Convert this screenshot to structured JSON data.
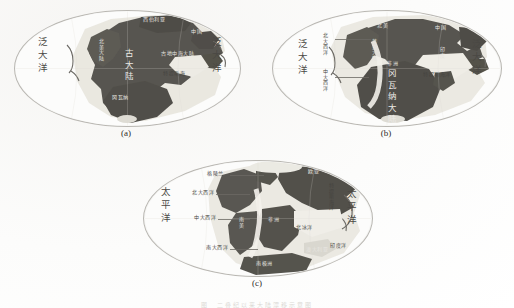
{
  "figure": {
    "bottom_caption": "图  二叠纪以来大陆漂移示意图",
    "panels": [
      {
        "id": "a",
        "caption": "(a)",
        "labels": {
          "left_ocean": "泛大洋",
          "right_ocean": "泛大洋",
          "center_land": "古大陆",
          "north_land": "西伯利亚",
          "northwest_land": "北美大陆",
          "northeast_land": "中国",
          "east_land": "中国",
          "tethys": "特提斯海",
          "south_land": "冈瓦纳",
          "inner_sea": "古地中海大陆"
        }
      },
      {
        "id": "b",
        "caption": "(b)",
        "labels": {
          "left_ocean": "泛大洋",
          "right_ocean": "泛大洋",
          "north_atlantic": "北大西洋",
          "central_atlantic": "中大西洋",
          "gondwana": "冈瓦纳大陆",
          "tethys": "特提斯海洋",
          "north_land": "北美",
          "northeast_land": "中国",
          "laurasia": "劳亚大陆",
          "africa": "非洲",
          "east_land": "印度"
        }
      },
      {
        "id": "c",
        "caption": "(c)",
        "labels": {
          "left_ocean": "太平洋",
          "right_ocean": "太平洋",
          "greenland": "格陵兰",
          "north_atlantic": "北大西洋",
          "central_atlantic": "中大西洋",
          "south_atlantic": "南大西洋",
          "tethys": "特提斯海洋",
          "indian_ocean": "印度洋",
          "arctic_ocean": "北冰洋",
          "antarctic": "南极洲",
          "africa": "非洲",
          "south_america": "南美",
          "eurasia": "欧亚",
          "australia": "澳大利亚"
        }
      }
    ]
  },
  "colors": {
    "land": "#5b5954",
    "shelf": "#e2e0d8",
    "ocean": "#fcfcfb",
    "outline": "#b9b7b2",
    "text_dark": "#3c3a37",
    "text_light": "#eceae6"
  }
}
